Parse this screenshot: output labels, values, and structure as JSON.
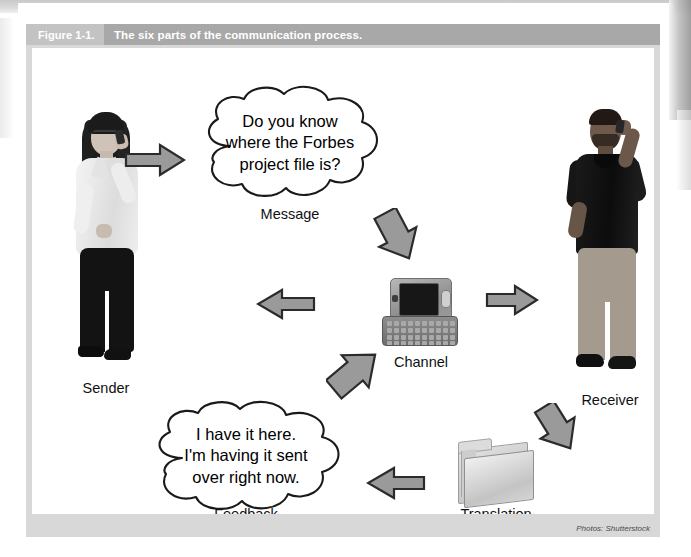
{
  "figure": {
    "number_label": "Figure 1-1.",
    "caption_title": "The six parts of the communication process.",
    "credit": "Photos: Shutterstock"
  },
  "diagram": {
    "type": "communication-process-cycle",
    "nodes": [
      {
        "id": "sender",
        "label": "Sender",
        "kind": "photo-woman-on-phone"
      },
      {
        "id": "message",
        "label": "Message",
        "kind": "speech-cloud"
      },
      {
        "id": "channel",
        "label": "Channel",
        "kind": "photo-mobile-phone"
      },
      {
        "id": "receiver",
        "label": "Receiver",
        "kind": "photo-man-on-phone"
      },
      {
        "id": "translation",
        "label": "Translation",
        "kind": "photo-file-folder"
      },
      {
        "id": "feedback",
        "label": "Feedback",
        "kind": "speech-cloud"
      }
    ],
    "clouds": [
      {
        "id": "message-cloud",
        "lines": [
          "Do you know",
          "where the Forbes",
          "project file is?"
        ]
      },
      {
        "id": "feedback-cloud",
        "lines": [
          "I have it here.",
          "I'm having it sent",
          "over right now."
        ]
      }
    ],
    "arrows": [
      {
        "id": "sender-to-message",
        "direction": "right",
        "from": "sender",
        "to": "message"
      },
      {
        "id": "message-to-channel",
        "direction": "down-right",
        "from": "message",
        "to": "channel"
      },
      {
        "id": "channel-to-receiver",
        "direction": "right",
        "from": "channel",
        "to": "receiver"
      },
      {
        "id": "receiver-to-translation",
        "direction": "down-right",
        "from": "receiver",
        "to": "translation"
      },
      {
        "id": "translation-to-feedback",
        "direction": "left",
        "from": "translation",
        "to": "feedback"
      },
      {
        "id": "feedback-to-channel",
        "direction": "up-right",
        "from": "feedback",
        "to": "channel"
      },
      {
        "id": "channel-to-sender",
        "direction": "left",
        "from": "channel",
        "to": "sender"
      }
    ],
    "colors": {
      "arrow_fill": "#9a9a9a",
      "arrow_stroke": "#2b2b2b",
      "caption_number_bg": "#c3c3c3",
      "caption_title_bg": "#a8a8a8",
      "caption_text": "#ffffff",
      "frame_bg": "#d8d8d8",
      "canvas_bg": "#ffffff"
    }
  }
}
